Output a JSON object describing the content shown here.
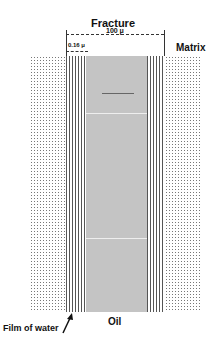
{
  "diagram": {
    "title": "Fracture",
    "fracture_width_label": "100 μ",
    "film_width_label": "0.16 μ",
    "matrix_label": "Matrix",
    "oil_label": "Oil",
    "water_label": "Film of water"
  }
}
